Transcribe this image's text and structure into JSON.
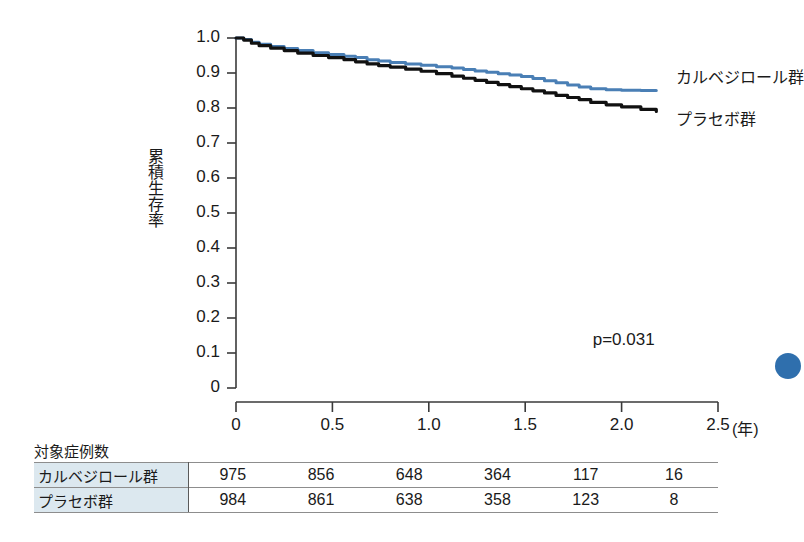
{
  "chart_data": {
    "type": "line",
    "title": "",
    "subtitle": "",
    "xlabel": "",
    "ylabel": "累積生存率",
    "x_unit": "(年)",
    "xlim": [
      0,
      2.5
    ],
    "ylim": [
      0,
      1.0
    ],
    "xticks": [
      "0",
      "0.5",
      "1.0",
      "1.5",
      "2.0",
      "2.5"
    ],
    "xtick_values": [
      0,
      0.5,
      1.0,
      1.5,
      2.0,
      2.5
    ],
    "yticks": [
      "0",
      "0.1",
      "0.2",
      "0.3",
      "0.4",
      "0.5",
      "0.6",
      "0.7",
      "0.8",
      "0.9",
      "1.0"
    ],
    "ytick_values": [
      0,
      0.1,
      0.2,
      0.3,
      0.4,
      0.5,
      0.6,
      0.7,
      0.8,
      0.9,
      1.0
    ],
    "grid": false,
    "legend_position": "right-inline",
    "annotations": [
      {
        "text": "p=0.031",
        "x": 1.85,
        "y": 0.135
      }
    ],
    "series": [
      {
        "name": "カルベジロール群",
        "color": "#4a7fb5",
        "label_x": 2.28,
        "label_y": 0.895,
        "points": [
          [
            0.0,
            1.0
          ],
          [
            0.04,
            0.996
          ],
          [
            0.08,
            0.988
          ],
          [
            0.12,
            0.982
          ],
          [
            0.18,
            0.976
          ],
          [
            0.25,
            0.97
          ],
          [
            0.32,
            0.964
          ],
          [
            0.4,
            0.958
          ],
          [
            0.48,
            0.953
          ],
          [
            0.56,
            0.948
          ],
          [
            0.62,
            0.944
          ],
          [
            0.68,
            0.938
          ],
          [
            0.74,
            0.934
          ],
          [
            0.8,
            0.93
          ],
          [
            0.88,
            0.926
          ],
          [
            0.96,
            0.922
          ],
          [
            1.04,
            0.918
          ],
          [
            1.12,
            0.914
          ],
          [
            1.18,
            0.91
          ],
          [
            1.24,
            0.906
          ],
          [
            1.3,
            0.902
          ],
          [
            1.36,
            0.898
          ],
          [
            1.42,
            0.894
          ],
          [
            1.48,
            0.89
          ],
          [
            1.54,
            0.884
          ],
          [
            1.6,
            0.878
          ],
          [
            1.66,
            0.872
          ],
          [
            1.72,
            0.866
          ],
          [
            1.78,
            0.86
          ],
          [
            1.84,
            0.855
          ],
          [
            1.92,
            0.852
          ],
          [
            2.0,
            0.851
          ],
          [
            2.1,
            0.85
          ],
          [
            2.18,
            0.85
          ]
        ]
      },
      {
        "name": "プラセボ群",
        "color": "#111111",
        "label_x": 2.28,
        "label_y": 0.775,
        "points": [
          [
            0.0,
            1.0
          ],
          [
            0.04,
            0.994
          ],
          [
            0.08,
            0.985
          ],
          [
            0.12,
            0.978
          ],
          [
            0.18,
            0.971
          ],
          [
            0.25,
            0.964
          ],
          [
            0.32,
            0.957
          ],
          [
            0.4,
            0.95
          ],
          [
            0.48,
            0.944
          ],
          [
            0.56,
            0.938
          ],
          [
            0.62,
            0.932
          ],
          [
            0.68,
            0.926
          ],
          [
            0.74,
            0.921
          ],
          [
            0.8,
            0.917
          ],
          [
            0.88,
            0.911
          ],
          [
            0.96,
            0.905
          ],
          [
            1.04,
            0.898
          ],
          [
            1.12,
            0.891
          ],
          [
            1.18,
            0.885
          ],
          [
            1.24,
            0.879
          ],
          [
            1.3,
            0.873
          ],
          [
            1.36,
            0.867
          ],
          [
            1.42,
            0.861
          ],
          [
            1.48,
            0.855
          ],
          [
            1.54,
            0.849
          ],
          [
            1.6,
            0.843
          ],
          [
            1.66,
            0.836
          ],
          [
            1.72,
            0.83
          ],
          [
            1.78,
            0.824
          ],
          [
            1.84,
            0.816
          ],
          [
            1.92,
            0.809
          ],
          [
            2.0,
            0.803
          ],
          [
            2.1,
            0.796
          ],
          [
            2.18,
            0.79
          ]
        ]
      }
    ]
  },
  "risk_table": {
    "caption": "対象症例数",
    "rows": [
      {
        "label": "カルベジロール群",
        "values": [
          "975",
          "856",
          "648",
          "364",
          "117",
          "16"
        ]
      },
      {
        "label": "プラセボ群",
        "values": [
          "984",
          "861",
          "638",
          "358",
          "123",
          "8"
        ]
      }
    ]
  },
  "colors": {
    "carvedilol": "#4a7fb5",
    "placebo": "#111111",
    "axis": "#3a3a3a",
    "table_label_bg": "#dce8ef",
    "edge_dot": "#2f6fad"
  }
}
